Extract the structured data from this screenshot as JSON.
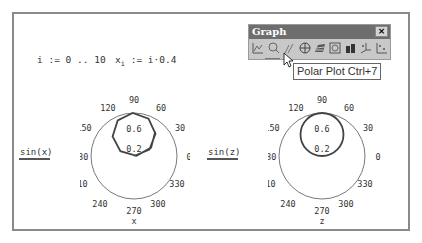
{
  "worksheet": {
    "definitions": {
      "range": "i := 0 .. 10",
      "x_def_lhs": "x",
      "x_def_sub": "i",
      "x_def_rhs": " := i·0.4"
    }
  },
  "graph_toolbar": {
    "title": "Graph",
    "close_label": "×",
    "tools": [
      {
        "name": "xy-plot-icon",
        "label": "X-Y Plot"
      },
      {
        "name": "polar-plot-outline-icon",
        "label": "Zoom"
      },
      {
        "name": "trace-icon",
        "label": "Trace"
      },
      {
        "name": "polar-plot-icon",
        "label": "Polar Plot"
      },
      {
        "name": "surface-plot-icon",
        "label": "Surface Plot"
      },
      {
        "name": "contour-plot-icon",
        "label": "Contour Plot"
      },
      {
        "name": "bar-plot-3d-icon",
        "label": "3D Bar Plot"
      },
      {
        "name": "scatter-plot-3d-icon",
        "label": "3D Scatter Plot"
      },
      {
        "name": "vector-field-icon",
        "label": "Vector Field Plot"
      }
    ],
    "tooltip": "Polar Plot Ctrl+7"
  },
  "chart_data": [
    {
      "type": "polar",
      "trace_label": "sin(x)",
      "angle_label": "x",
      "angle_ticks": [
        "90",
        "60",
        "30",
        "0",
        "330",
        "300",
        "270",
        "240",
        "210",
        "180",
        "150",
        "120"
      ],
      "radial_ticks": [
        "0.2",
        "0.6"
      ],
      "r_max": 1,
      "theta_rad": [
        0,
        0.4,
        0.8,
        1.2,
        1.6,
        2.0,
        2.4,
        2.8,
        3.2,
        3.6,
        4.0
      ],
      "r": [
        0,
        0.389,
        0.717,
        0.932,
        1.0,
        0.909,
        0.675,
        0.335,
        -0.058,
        -0.443,
        -0.757
      ]
    },
    {
      "type": "polar",
      "trace_label": "sin(z)",
      "angle_label": "z",
      "angle_ticks": [
        "90",
        "60",
        "30",
        "0",
        "330",
        "300",
        "270",
        "240",
        "210",
        "180",
        "150",
        "120"
      ],
      "radial_ticks": [
        "0.2",
        "0.6"
      ],
      "r_max": 1,
      "function": "r = sin(z), continuous"
    }
  ]
}
